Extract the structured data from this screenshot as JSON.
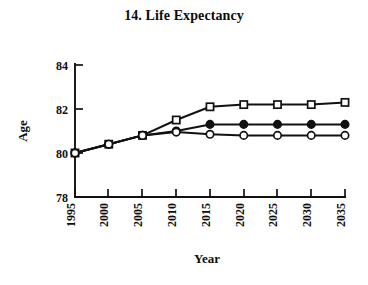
{
  "figure": {
    "title": "14. Life Expectancy"
  },
  "chart_data": {
    "type": "line",
    "title": "14. Life Expectancy",
    "xlabel": "Year",
    "ylabel": "Age",
    "categories": [
      "1995",
      "2000",
      "2005",
      "2010",
      "2015",
      "2020",
      "2025",
      "2030",
      "2035"
    ],
    "x": [
      1995,
      2000,
      2005,
      2010,
      2015,
      2020,
      2025,
      2030,
      2035
    ],
    "xlim": [
      1995,
      2035
    ],
    "ylim": [
      78,
      84
    ],
    "yticks": [
      "78",
      "80",
      "82",
      "84"
    ],
    "ytick_values": [
      78,
      80,
      82,
      84
    ],
    "xticks": [
      "1995",
      "2000",
      "2005",
      "2010",
      "2015",
      "2020",
      "2025",
      "2030",
      "2035"
    ],
    "grid": false,
    "legend": "none",
    "xtick_rotation": 90,
    "series": [
      {
        "name": "square-series",
        "marker": "open-square",
        "values": [
          80.0,
          80.4,
          80.8,
          81.5,
          82.1,
          82.2,
          82.2,
          82.2,
          82.3
        ]
      },
      {
        "name": "filled-circle-series",
        "marker": "filled-circle",
        "values": [
          80.0,
          80.4,
          80.8,
          81.0,
          81.3,
          81.3,
          81.3,
          81.3,
          81.3
        ]
      },
      {
        "name": "open-circle-series",
        "marker": "open-circle",
        "values": [
          80.0,
          80.4,
          80.8,
          80.95,
          80.85,
          80.8,
          80.8,
          80.8,
          80.8
        ]
      }
    ]
  }
}
